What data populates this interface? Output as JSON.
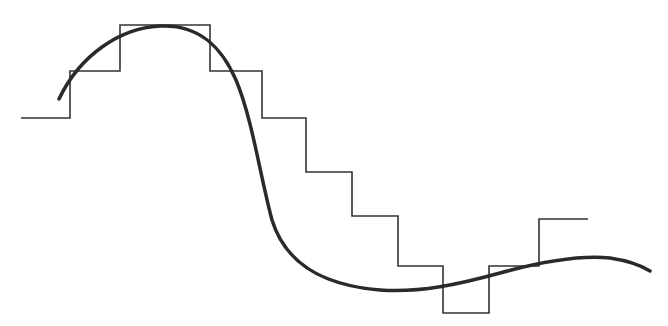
{
  "diagram": {
    "background": "#ffffff",
    "step_function": {
      "color": "#333333",
      "stroke_width": 1.6,
      "points": [
        [
          21,
          118
        ],
        [
          70,
          118
        ],
        [
          70,
          71
        ],
        [
          120,
          71
        ],
        [
          120,
          25
        ],
        [
          210,
          25
        ],
        [
          210,
          71
        ],
        [
          262,
          71
        ],
        [
          262,
          118
        ],
        [
          306,
          118
        ],
        [
          306,
          172
        ],
        [
          352,
          172
        ],
        [
          352,
          216
        ],
        [
          398,
          216
        ],
        [
          398,
          266
        ],
        [
          443,
          266
        ],
        [
          443,
          313
        ],
        [
          489,
          313
        ],
        [
          489,
          266
        ],
        [
          539,
          266
        ],
        [
          539,
          219
        ],
        [
          588,
          219
        ]
      ]
    },
    "smooth_curve": {
      "color": "#2a2a2a",
      "stroke_width": 3.5,
      "path": "M59,99 C80,55 120,28 160,26 C200,24 222,48 236,80 C252,118 260,175 272,220 C285,262 320,285 380,290 C420,293 460,284 500,273 C540,262 580,255 610,258 C630,261 642,266 650,271"
    }
  }
}
